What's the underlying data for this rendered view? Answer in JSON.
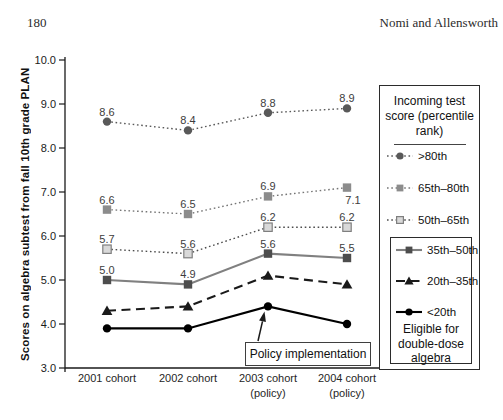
{
  "page": {
    "number": "180",
    "running_head": "Nomi and Allensworth"
  },
  "legend": {
    "title": "Incoming test score (percentile rank)",
    "eligible_note": "Eligible for double-dose algebra"
  },
  "chart_data": {
    "type": "line",
    "title": "",
    "xlabel": "",
    "ylabel": "Scores on algebra subtest from fall 10th grade PLAN",
    "ylim": [
      3.0,
      10.0
    ],
    "ytick_labels": [
      "3.0",
      "4.0",
      "5.0",
      "6.0",
      "7.0",
      "8.0",
      "9.0",
      "10.0"
    ],
    "grid": false,
    "legend_position": "right",
    "categories": [
      [
        "2001 cohort"
      ],
      [
        "2002 cohort"
      ],
      [
        "2003 cohort",
        "(policy)"
      ],
      [
        "2004 cohort",
        "(policy)"
      ]
    ],
    "series": [
      {
        "name": ">80th",
        "values": [
          8.6,
          8.4,
          8.8,
          8.9
        ],
        "labels": [
          "8.6",
          "8.4",
          "8.8",
          "8.9"
        ],
        "marker": "circle",
        "marker_color": "#595959",
        "line": "dotted",
        "line_color": "#595959"
      },
      {
        "name": "65th–80th",
        "values": [
          6.6,
          6.5,
          6.9,
          7.1
        ],
        "labels": [
          "6.6",
          "6.5",
          "6.9",
          "7.1"
        ],
        "label_offsets": [
          [
            0,
            -6
          ],
          [
            0,
            -6
          ],
          [
            0,
            -6
          ],
          [
            6,
            16
          ]
        ],
        "marker": "square",
        "marker_color": "#8c8c8c",
        "line": "dotted",
        "line_color": "#757575"
      },
      {
        "name": "50th–65th",
        "values": [
          5.7,
          5.6,
          6.2,
          6.2
        ],
        "labels": [
          "5.7",
          "5.6",
          "6.2",
          "6.2"
        ],
        "marker": "square-open",
        "marker_color": "#d9d9d9",
        "marker_border": "#7f7f7f",
        "line": "dotted",
        "line_color": "#4d4d4d"
      },
      {
        "name": "35th–50th",
        "values": [
          5.0,
          4.9,
          5.6,
          5.5
        ],
        "labels": [
          "5.0",
          "4.9",
          "5.6",
          "5.5"
        ],
        "marker": "square",
        "marker_color": "#4d4d4d",
        "line": "solid",
        "line_color": "#808080"
      },
      {
        "name": "20th–35th",
        "values": [
          4.3,
          4.4,
          5.1,
          4.9
        ],
        "labels": null,
        "marker": "triangle",
        "marker_color": "#1a1a1a",
        "line": "dashed",
        "line_color": "#1a1a1a"
      },
      {
        "name": "<20th",
        "values": [
          3.9,
          3.9,
          4.4,
          4.0
        ],
        "labels": null,
        "marker": "circle",
        "marker_color": "#000000",
        "line": "solid",
        "line_color": "#000000"
      }
    ],
    "eligible_series_count": 3,
    "annotation": {
      "text": "Policy implementation",
      "points_to": "2003 cohort"
    }
  }
}
